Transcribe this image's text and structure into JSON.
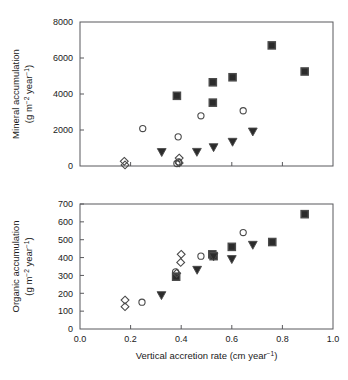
{
  "figure": {
    "background_color": "#ffffff",
    "frame_color": "#59595c",
    "marker_fill_dark": "#2b2b2b",
    "marker_stroke": "#4a4a4a"
  },
  "panels": {
    "top": {
      "name": "mineral-accumulation-panel",
      "ylabel_line1": "Mineral accumulation",
      "ylabel_line2_pre": "(g m",
      "ylabel_line2_sup1": "−2",
      "ylabel_line2_mid": " year",
      "ylabel_line2_sup2": "−1",
      "ylabel_line2_post": ")",
      "ytick_labels": [
        "0",
        "2000",
        "4000",
        "6000",
        "8000"
      ]
    },
    "bottom": {
      "name": "organic-accumulation-panel",
      "ylabel_line1": "Organic accumulation",
      "ylabel_line2_pre": "(g m",
      "ylabel_line2_sup1": "−2",
      "ylabel_line2_mid": " year",
      "ylabel_line2_sup2": "−1",
      "ylabel_line2_post": ")",
      "ytick_labels": [
        "0",
        "100",
        "200",
        "300",
        "400",
        "500",
        "600",
        "700"
      ],
      "xtick_labels": [
        "0.0",
        "0.2",
        "0.4",
        "0.6",
        "0.8",
        "1.0"
      ],
      "xlabel_pre": "Vertical accretion rate (cm year",
      "xlabel_sup": "−1",
      "xlabel_post": ")"
    }
  },
  "chart_data": [
    {
      "type": "scatter",
      "title": "",
      "xlabel": "Vertical accretion rate (cm year-1)",
      "ylabel": "Mineral accumulation (g m-2 year-1)",
      "xlim": [
        0.0,
        1.0
      ],
      "ylim": [
        0,
        8000
      ],
      "xticks": [
        0.0,
        0.2,
        0.4,
        0.6,
        0.8,
        1.0
      ],
      "yticks": [
        0,
        2000,
        4000,
        6000,
        8000
      ],
      "grid": false,
      "legend": "none",
      "series": [
        {
          "name": "filled-square",
          "marker": "square",
          "fill": "#2b2b2b",
          "points": [
            {
              "x": 0.383,
              "y": 3900
            },
            {
              "x": 0.525,
              "y": 4650
            },
            {
              "x": 0.525,
              "y": 3520
            },
            {
              "x": 0.603,
              "y": 4930
            },
            {
              "x": 0.758,
              "y": 6700
            },
            {
              "x": 0.888,
              "y": 5250
            }
          ]
        },
        {
          "name": "open-circle",
          "marker": "circle",
          "fill": "none",
          "points": [
            {
              "x": 0.248,
              "y": 2080
            },
            {
              "x": 0.388,
              "y": 1620
            },
            {
              "x": 0.383,
              "y": 140
            },
            {
              "x": 0.39,
              "y": 230
            },
            {
              "x": 0.478,
              "y": 2790
            },
            {
              "x": 0.645,
              "y": 3070
            }
          ]
        },
        {
          "name": "filled-triangle-down",
          "marker": "triangle-down",
          "fill": "#2b2b2b",
          "points": [
            {
              "x": 0.323,
              "y": 760
            },
            {
              "x": 0.462,
              "y": 770
            },
            {
              "x": 0.528,
              "y": 1030
            },
            {
              "x": 0.603,
              "y": 1330
            },
            {
              "x": 0.683,
              "y": 1900
            }
          ]
        },
        {
          "name": "open-diamond",
          "marker": "diamond",
          "fill": "none",
          "points": [
            {
              "x": 0.175,
              "y": 260
            },
            {
              "x": 0.178,
              "y": 60
            },
            {
              "x": 0.392,
              "y": 440
            },
            {
              "x": 0.392,
              "y": 170
            }
          ]
        }
      ]
    },
    {
      "type": "scatter",
      "title": "",
      "xlabel": "Vertical accretion rate (cm year-1)",
      "ylabel": "Organic accumulation (g m-2 year-1)",
      "xlim": [
        0.0,
        1.0
      ],
      "ylim": [
        0,
        700
      ],
      "xticks": [
        0.0,
        0.2,
        0.4,
        0.6,
        0.8,
        1.0
      ],
      "yticks": [
        0,
        100,
        200,
        300,
        400,
        500,
        600,
        700
      ],
      "grid": false,
      "legend": "none",
      "series": [
        {
          "name": "filled-square",
          "marker": "square",
          "fill": "#2b2b2b",
          "points": [
            {
              "x": 0.38,
              "y": 293
            },
            {
              "x": 0.523,
              "y": 418
            },
            {
              "x": 0.528,
              "y": 408
            },
            {
              "x": 0.6,
              "y": 460
            },
            {
              "x": 0.76,
              "y": 487
            },
            {
              "x": 0.888,
              "y": 643
            }
          ]
        },
        {
          "name": "open-circle",
          "marker": "circle",
          "fill": "none",
          "points": [
            {
              "x": 0.245,
              "y": 150
            },
            {
              "x": 0.378,
              "y": 320
            },
            {
              "x": 0.478,
              "y": 408
            },
            {
              "x": 0.645,
              "y": 540
            }
          ]
        },
        {
          "name": "filled-triangle-down",
          "marker": "triangle-down",
          "fill": "#2b2b2b",
          "points": [
            {
              "x": 0.322,
              "y": 188
            },
            {
              "x": 0.463,
              "y": 330
            },
            {
              "x": 0.528,
              "y": 405
            },
            {
              "x": 0.6,
              "y": 390
            },
            {
              "x": 0.683,
              "y": 470
            }
          ]
        },
        {
          "name": "open-diamond",
          "marker": "diamond",
          "fill": "none",
          "points": [
            {
              "x": 0.178,
              "y": 162
            },
            {
              "x": 0.178,
              "y": 125
            },
            {
              "x": 0.4,
              "y": 418
            },
            {
              "x": 0.398,
              "y": 373
            },
            {
              "x": 0.382,
              "y": 312
            }
          ]
        }
      ]
    }
  ]
}
